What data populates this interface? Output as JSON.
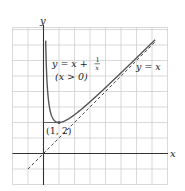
{
  "chart_data": {
    "type": "line",
    "title": "",
    "xlabel": "x",
    "ylabel": "y",
    "xlim": [
      -2,
      8
    ],
    "ylim": [
      -2,
      8
    ],
    "grid": true,
    "grid_step": 1,
    "series": [
      {
        "name": "y = x + 1/x (x > 0)",
        "style": "solid",
        "domain": [
          0.14,
          7.2
        ],
        "x": [
          0.14,
          0.2,
          0.25,
          0.33,
          0.5,
          0.75,
          1,
          1.5,
          2,
          3,
          4,
          5,
          6,
          7,
          7.2
        ],
        "values": [
          7.28,
          5.2,
          4.25,
          3.36,
          2.5,
          2.08,
          2,
          2.17,
          2.5,
          3.33,
          4.25,
          5.2,
          6.17,
          7.14,
          7.34
        ]
      },
      {
        "name": "y = x",
        "style": "dashed",
        "x": [
          -1,
          7.2
        ],
        "values": [
          -1,
          7.2
        ]
      }
    ],
    "annotations": [
      {
        "text": "(1, 2)",
        "x": 1,
        "y": 2,
        "type": "point"
      }
    ]
  },
  "labels": {
    "x_axis": "x",
    "y_axis": "y",
    "curve_lhs": "y = x + ",
    "curve_frac_num": "1",
    "curve_frac_den": "x",
    "curve_domain": "(x > 0)",
    "asymptote": "y = x",
    "point": "(1, 2)"
  }
}
